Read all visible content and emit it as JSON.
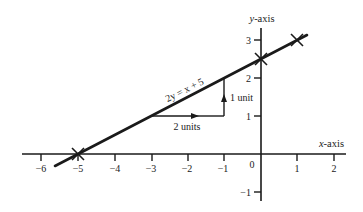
{
  "diagram": {
    "type": "coordinate-graph",
    "colors": {
      "ink": "#1a1a1a",
      "background": "#ffffff"
    },
    "axes": {
      "x_label_var": "x",
      "x_label_suffix": "-axis",
      "y_label_var": "y",
      "y_label_suffix": "-axis",
      "x_ticks": [
        {
          "value": -6,
          "label": "−6"
        },
        {
          "value": -5,
          "label": "−5"
        },
        {
          "value": -4,
          "label": "−4"
        },
        {
          "value": -3,
          "label": "−3"
        },
        {
          "value": -2,
          "label": "−2"
        },
        {
          "value": -1,
          "label": "−1"
        },
        {
          "value": 1,
          "label": "1"
        },
        {
          "value": 2,
          "label": "2"
        }
      ],
      "origin_label": "0",
      "y_ticks": [
        {
          "value": 3,
          "label": "3"
        },
        {
          "value": 2,
          "label": "2"
        },
        {
          "value": 1,
          "label": "1"
        },
        {
          "value": -1,
          "label": "−1"
        }
      ]
    },
    "line": {
      "equation_label": "2y = x + 5",
      "marked_points": [
        {
          "x": -5,
          "y": 0
        },
        {
          "x": 0,
          "y": 2.5
        },
        {
          "x": 1,
          "y": 3
        }
      ]
    },
    "gradient_triangle": {
      "run_label": "2 units",
      "rise_label": "1 unit",
      "start": {
        "x": -3,
        "y": 1
      },
      "corner": {
        "x": -1,
        "y": 1
      },
      "end": {
        "x": -1,
        "y": 2
      }
    }
  }
}
